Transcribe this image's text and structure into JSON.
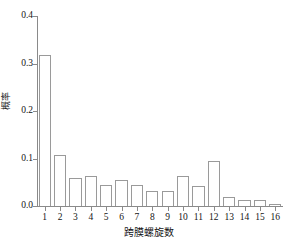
{
  "chart_data": {
    "type": "bar",
    "title": "",
    "xlabel": "跨膜螺旋数",
    "ylabel": "概率",
    "categories": [
      "1",
      "2",
      "3",
      "4",
      "5",
      "6",
      "7",
      "8",
      "9",
      "10",
      "11",
      "12",
      "13",
      "14",
      "15",
      "16"
    ],
    "values": [
      0.318,
      0.108,
      0.06,
      0.064,
      0.045,
      0.054,
      0.044,
      0.032,
      0.031,
      0.064,
      0.043,
      0.094,
      0.018,
      0.012,
      0.012,
      0.005
    ],
    "ylim": [
      0.0,
      0.4
    ],
    "yticks": [
      "0.0",
      "0.1",
      "0.2",
      "0.3",
      "0.4"
    ],
    "ytick_values": [
      0.0,
      0.1,
      0.2,
      0.3,
      0.4
    ],
    "grid": false,
    "legend": "none",
    "bar_facecolor": "#ffffff",
    "bar_edgecolor": "#9a9a9a",
    "axis_color": "#8a8a8a",
    "text_color": "#141414",
    "background": "#ffffff"
  }
}
